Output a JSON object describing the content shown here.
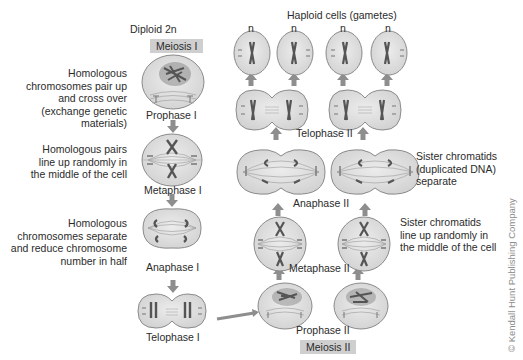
{
  "header": {
    "diploid_label": "Diploid  2n",
    "haploid_label": "Haploid cells (gametes)",
    "gamete_ploidy_labels": [
      "n",
      "n",
      "n",
      "n"
    ]
  },
  "sections": {
    "meiosis_1": "Meiosis I",
    "meiosis_2": "Meiosis II"
  },
  "meiosis_1_stages": [
    {
      "name": "Prophase I",
      "description": "Homologous\nchromosomes pair up\nand cross over\n(exchange genetic\nmaterials)"
    },
    {
      "name": "Metaphase I",
      "description": "Homologous pairs\nline up randomly in\nthe middle of the cell"
    },
    {
      "name": "Anaphase I",
      "description": "Homologous\nchromosomes separate\nand reduce chromosome\nnumber in half"
    },
    {
      "name": "Telophase I",
      "description": ""
    }
  ],
  "meiosis_2_stages": [
    {
      "name": "Prophase II",
      "description": ""
    },
    {
      "name": "Metaphase II",
      "description": "Sister chromatids\nline up randomly in\nthe middle of the cell"
    },
    {
      "name": "Anaphase II",
      "description": "Sister chromatids\n(duplicated DNA)\nseparate"
    },
    {
      "name": "Telophase II",
      "description": ""
    }
  ],
  "colors": {
    "cell_fill": "#dcdcdc",
    "cell_stroke": "#8a8a8a",
    "chromosome": "#5a5a5a",
    "arrow": "#8e8e8e",
    "badge_bg": "#cfcfcf"
  },
  "copyright": "© Kendall Hunt Publishing Company"
}
